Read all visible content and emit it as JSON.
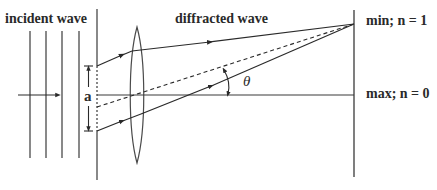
{
  "labels": {
    "incident": "incident wave",
    "diffracted": "diffracted wave",
    "slit_width": "a",
    "angle": "θ",
    "min": "min; n = 1",
    "max": "max; n = 0"
  },
  "colors": {
    "line": "#3a3a3a",
    "text": "#2a2a2a",
    "background": "#ffffff"
  }
}
